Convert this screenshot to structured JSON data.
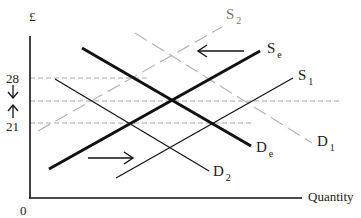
{
  "diagram": {
    "title": "",
    "axes": {
      "y_label": "£",
      "x_label": "Quantity",
      "origin_label": "0",
      "price_high": "28",
      "price_low": "21"
    },
    "curves": {
      "se": {
        "letter": "S",
        "sub": "e",
        "style": "thick solid"
      },
      "de": {
        "letter": "D",
        "sub": "e",
        "style": "thick solid"
      },
      "s1": {
        "letter": "S",
        "sub": "1",
        "style": "thin solid"
      },
      "d2": {
        "letter": "D",
        "sub": "2",
        "style": "thin solid"
      },
      "s2": {
        "letter": "S",
        "sub": "2",
        "style": "gray dashed"
      },
      "d1": {
        "letter": "D",
        "sub": "1",
        "style": "gray dashed"
      }
    },
    "arrows": {
      "supply_shift": "left",
      "demand_shift": "right",
      "price_28_arrow": "down",
      "price_21_arrow": "up"
    },
    "colors": {
      "line": "#111111",
      "gray_line": "#b5b5b5",
      "dashed_guide": "#a8a8a8"
    }
  }
}
